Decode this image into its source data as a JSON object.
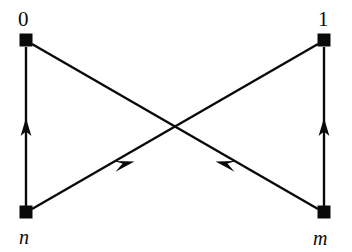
{
  "figure": {
    "kind": "directed-graph-diagram",
    "background_color": "#ffffff",
    "ink_color": "#0a0a0a",
    "width": 352,
    "height": 252
  },
  "nodes": [
    {
      "id": "zero",
      "label": "0",
      "label_style": "upright",
      "x": 26,
      "y": 40,
      "marker": "filled-square"
    },
    {
      "id": "one",
      "label": "1",
      "label_style": "upright",
      "x": 324,
      "y": 40,
      "marker": "filled-square"
    },
    {
      "id": "n",
      "label": "n",
      "label_style": "italic",
      "x": 26,
      "y": 212,
      "marker": "filled-square"
    },
    {
      "id": "m",
      "label": "m",
      "label_style": "italic",
      "x": 324,
      "y": 212,
      "marker": "filled-square"
    }
  ],
  "edges": [
    {
      "id": "edge-n-to-zero",
      "from": "n",
      "to": "zero",
      "shape": "vertical",
      "arrow": "up",
      "arrow_position": 0.47
    },
    {
      "id": "edge-m-to-one",
      "from": "m",
      "to": "one",
      "shape": "vertical",
      "arrow": "up",
      "arrow_position": 0.47
    },
    {
      "id": "edge-n-to-one",
      "from": "n",
      "to": "one",
      "shape": "diagonal",
      "arrow": "up-right",
      "arrow_position": 0.42
    },
    {
      "id": "edge-m-to-zero",
      "from": "m",
      "to": "zero",
      "shape": "diagonal",
      "arrow": "up-left",
      "arrow_position": 0.42
    }
  ],
  "labels": {
    "top_left": "0",
    "top_right": "1",
    "bottom_left": "n",
    "bottom_right": "m"
  },
  "geometry": {
    "node_square_size": 13,
    "edge_stroke_width": 2.4,
    "crossing_point": {
      "x": 175,
      "y": 126
    }
  }
}
